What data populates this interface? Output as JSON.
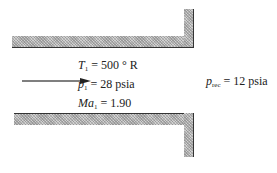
{
  "diagram": {
    "type": "converging duct exit into receiver",
    "flow_arrow": {
      "direction": "right"
    },
    "inlet_conditions": [
      {
        "symbol": "T",
        "subscript": "1",
        "equals": "= 500 ° R"
      },
      {
        "symbol": "p",
        "subscript": "1",
        "equals": "= 28 psia"
      },
      {
        "symbol": "Ma",
        "subscript": "1",
        "equals": "= 1.90"
      }
    ],
    "receiver": {
      "symbol": "p",
      "subscript": "rec",
      "equals": "= 12 psia"
    },
    "colors": {
      "wall_fill": "#b9b9b9",
      "wall_edge": "#333333",
      "arrow": "#555555",
      "text": "#222222"
    }
  }
}
